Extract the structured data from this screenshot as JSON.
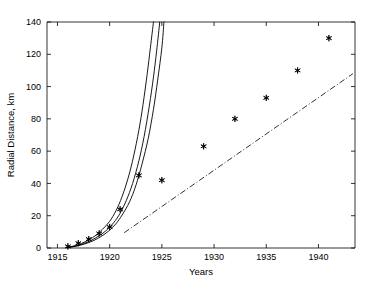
{
  "chart_data": {
    "type": "scatter",
    "title": "",
    "xlabel": "Years",
    "ylabel": "Radial Distance, km",
    "xlim": [
      1914.0,
      1943.5
    ],
    "ylim": [
      0,
      140
    ],
    "xticks": [
      1915,
      1920,
      1925,
      1930,
      1935,
      1940
    ],
    "xticklabels": [
      "1915",
      "1920",
      "1925",
      "1930",
      "1935",
      "1940"
    ],
    "yticks": [
      0,
      20,
      40,
      60,
      80,
      100,
      120,
      140
    ],
    "yticklabels": [
      "0",
      "20",
      "40",
      "60",
      "80",
      "100",
      "120",
      "140"
    ],
    "grid": false,
    "legend": "none",
    "series": [
      {
        "name": "observed-data",
        "type": "scatter",
        "marker": "star",
        "color": "#000000",
        "points": [
          {
            "x": 1916.0,
            "y": 1.0
          },
          {
            "x": 1917.0,
            "y": 3.0
          },
          {
            "x": 1918.0,
            "y": 5.5
          },
          {
            "x": 1919.0,
            "y": 9.0
          },
          {
            "x": 1920.0,
            "y": 13.0
          },
          {
            "x": 1921.0,
            "y": 24.0
          },
          {
            "x": 1922.8,
            "y": 45.0
          },
          {
            "x": 1925.0,
            "y": 42.0
          },
          {
            "x": 1929.0,
            "y": 63.0
          },
          {
            "x": 1932.0,
            "y": 80.0
          },
          {
            "x": 1935.0,
            "y": 93.0
          },
          {
            "x": 1938.0,
            "y": 110.0
          },
          {
            "x": 1941.0,
            "y": 130.0
          }
        ]
      },
      {
        "name": "model-curve-1",
        "type": "line",
        "style": "solid",
        "color": "#000000",
        "points": [
          {
            "x": 1915.9,
            "y": 0.4
          },
          {
            "x": 1916.6,
            "y": 1.3
          },
          {
            "x": 1917.3,
            "y": 2.8
          },
          {
            "x": 1918.0,
            "y": 5.0
          },
          {
            "x": 1918.7,
            "y": 8.0
          },
          {
            "x": 1919.3,
            "y": 11.5
          },
          {
            "x": 1920.0,
            "y": 16.5
          },
          {
            "x": 1920.6,
            "y": 23.0
          },
          {
            "x": 1921.2,
            "y": 32.0
          },
          {
            "x": 1921.8,
            "y": 44.0
          },
          {
            "x": 1922.3,
            "y": 57.0
          },
          {
            "x": 1922.8,
            "y": 73.0
          },
          {
            "x": 1923.2,
            "y": 89.0
          },
          {
            "x": 1923.6,
            "y": 108.0
          },
          {
            "x": 1923.9,
            "y": 124.0
          },
          {
            "x": 1924.2,
            "y": 140.0
          }
        ]
      },
      {
        "name": "model-curve-2",
        "type": "line",
        "style": "solid",
        "color": "#000000",
        "points": [
          {
            "x": 1915.9,
            "y": 0.3
          },
          {
            "x": 1916.7,
            "y": 1.2
          },
          {
            "x": 1917.5,
            "y": 2.7
          },
          {
            "x": 1918.2,
            "y": 4.6
          },
          {
            "x": 1919.0,
            "y": 7.6
          },
          {
            "x": 1919.7,
            "y": 11.0
          },
          {
            "x": 1920.4,
            "y": 15.8
          },
          {
            "x": 1921.0,
            "y": 21.5
          },
          {
            "x": 1921.6,
            "y": 29.5
          },
          {
            "x": 1922.2,
            "y": 40.0
          },
          {
            "x": 1922.8,
            "y": 54.0
          },
          {
            "x": 1923.3,
            "y": 69.0
          },
          {
            "x": 1923.8,
            "y": 88.0
          },
          {
            "x": 1924.2,
            "y": 106.0
          },
          {
            "x": 1924.5,
            "y": 122.0
          },
          {
            "x": 1924.8,
            "y": 140.0
          }
        ]
      },
      {
        "name": "model-curve-3",
        "type": "line",
        "style": "solid",
        "color": "#000000",
        "points": [
          {
            "x": 1915.9,
            "y": 0.25
          },
          {
            "x": 1916.8,
            "y": 1.1
          },
          {
            "x": 1917.6,
            "y": 2.5
          },
          {
            "x": 1918.4,
            "y": 4.4
          },
          {
            "x": 1919.2,
            "y": 7.2
          },
          {
            "x": 1919.9,
            "y": 10.5
          },
          {
            "x": 1920.6,
            "y": 15.0
          },
          {
            "x": 1921.2,
            "y": 20.5
          },
          {
            "x": 1921.9,
            "y": 28.5
          },
          {
            "x": 1922.5,
            "y": 38.5
          },
          {
            "x": 1923.1,
            "y": 52.0
          },
          {
            "x": 1923.7,
            "y": 68.0
          },
          {
            "x": 1924.2,
            "y": 86.0
          },
          {
            "x": 1924.6,
            "y": 104.0
          },
          {
            "x": 1925.0,
            "y": 124.0
          },
          {
            "x": 1925.2,
            "y": 140.0
          }
        ]
      },
      {
        "name": "linear-trend",
        "type": "line",
        "style": "dash-dot",
        "color": "#000000",
        "points": [
          {
            "x": 1921.4,
            "y": 9.5
          },
          {
            "x": 1943.3,
            "y": 108.0
          }
        ]
      }
    ]
  }
}
